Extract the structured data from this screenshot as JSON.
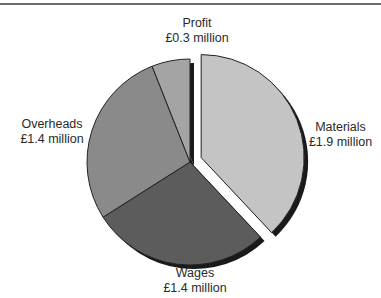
{
  "chart_data": {
    "type": "pie",
    "title": "",
    "unit": "£ million",
    "categories": [
      "Materials",
      "Wages",
      "Overheads",
      "Profit"
    ],
    "values": [
      1.9,
      1.4,
      1.4,
      0.3
    ],
    "labels": [
      "£1.9 million",
      "£1.4 million",
      "£1.4 million",
      "£0.3 million"
    ],
    "colors": [
      "#c4c4c4",
      "#5c5c5c",
      "#8a8a8a",
      "#a4a4a4"
    ],
    "exploded": [
      "Materials"
    ],
    "start_angle_deg": 0,
    "direction": "clockwise",
    "legend": "none (direct labels)"
  },
  "labels": {
    "materials": {
      "name": "Materials",
      "value": "£1.9 million"
    },
    "wages": {
      "name": "Wages",
      "value": "£1.4 million"
    },
    "overheads": {
      "name": "Overheads",
      "value": "£1.4 million"
    },
    "profit": {
      "name": "Profit",
      "value": "£0.3 million"
    }
  }
}
